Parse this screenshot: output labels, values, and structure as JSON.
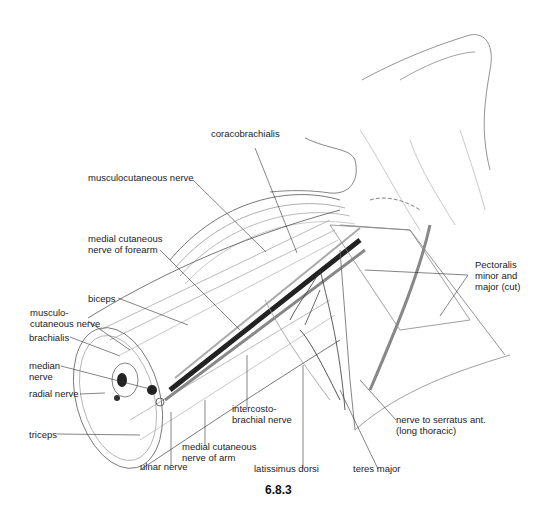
{
  "figure": {
    "number": "6.8.3",
    "labels": {
      "coracobrachialis": "coracobrachialis",
      "musculocutaneous_nerve_top": "musculocutaneous nerve",
      "medial_cutaneous_nerve_forearm": "medial cutaneous\nnerve of forearm",
      "biceps": "biceps",
      "musculocutaneous_nerve_left": "musculo-\ncutaneous nerve",
      "brachialis": "brachialis",
      "median_nerve": "median\nnerve",
      "radial_nerve": "radial nerve",
      "triceps": "triceps",
      "ulnar_nerve": "ulnar nerve",
      "medial_cutaneous_nerve_arm": "medial cutaneous\nnerve of arm",
      "intercostobrachial_nerve": "intercosto-\nbrachial nerve",
      "latissimus_dorsi": "latissimus dorsi",
      "teres_major": "teres major",
      "nerve_to_serratus": "nerve to serratus ant.\n(long thoracic)",
      "pectoralis": "Pectoralis\nminor and\nmajor (cut)"
    }
  }
}
